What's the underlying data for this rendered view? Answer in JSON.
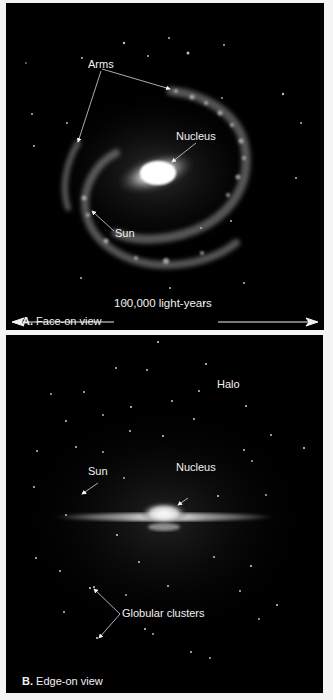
{
  "figure": {
    "panel_a": {
      "labels": {
        "arms": "Arms",
        "nucleus": "Nucleus",
        "sun": "Sun",
        "scale": "100,000 light-years"
      },
      "caption_letter": "A.",
      "caption_text": "Face-on view"
    },
    "panel_b": {
      "labels": {
        "halo": "Halo",
        "sun": "Sun",
        "nucleus": "Nucleus",
        "globular_clusters": "Globular clusters"
      },
      "caption_letter": "B.",
      "caption_text": "Edge-on view"
    }
  },
  "colors": {
    "background": "#000000",
    "text": "#f2f2f2",
    "page": "#f4f4f4"
  }
}
